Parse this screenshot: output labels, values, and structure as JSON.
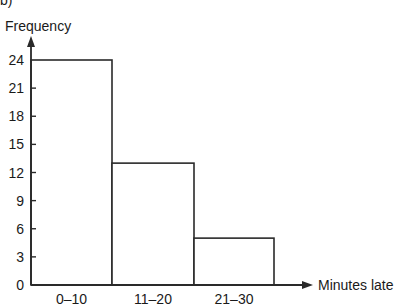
{
  "corner_text": "b)",
  "chart_data": {
    "type": "bar",
    "title": "",
    "xlabel": "Minutes late",
    "ylabel": "Frequency",
    "categories": [
      "0–10",
      "11–20",
      "21–30"
    ],
    "values": [
      24,
      13,
      5
    ],
    "yticks": [
      0,
      3,
      6,
      9,
      12,
      15,
      18,
      21,
      24
    ],
    "ylim": [
      0,
      24
    ],
    "grid": false,
    "legend": null,
    "bar_style": "histogram-outline"
  },
  "colors": {
    "stroke": "#2a2a2a",
    "fill": "#ffffff",
    "text": "#1a1a1a"
  }
}
